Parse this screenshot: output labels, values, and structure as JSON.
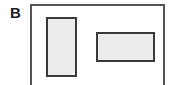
{
  "panel": {
    "label": "B"
  },
  "diagram": {
    "outer_frame": {
      "stroke": "#555555",
      "open_bottom": true
    },
    "shapes": [
      {
        "name": "tall-rectangle",
        "orientation": "vertical",
        "fill": "#ececec",
        "stroke": "#3a3a3a"
      },
      {
        "name": "wide-rectangle",
        "orientation": "horizontal",
        "fill": "#ececec",
        "stroke": "#3a3a3a"
      }
    ]
  }
}
